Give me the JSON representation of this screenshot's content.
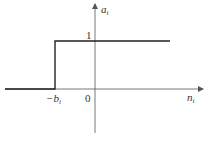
{
  "diagram": {
    "type": "step-function-plot",
    "y_axis_label": {
      "main": "a",
      "sub": "i"
    },
    "x_axis_label": {
      "main": "n",
      "sub": "i"
    },
    "origin_label": "0",
    "step_level_label": "1",
    "step_position_label": {
      "prefix": "−",
      "main": "b",
      "sub": "i"
    },
    "function": {
      "description": "a_i = 0 for n_i < -b_i; a_i = 1 for n_i >= -b_i",
      "low_value": 0,
      "high_value": 1,
      "step_at": "-b_i"
    },
    "colors": {
      "axis": "#555555",
      "function": "#222222",
      "background": "#ffffff"
    }
  }
}
